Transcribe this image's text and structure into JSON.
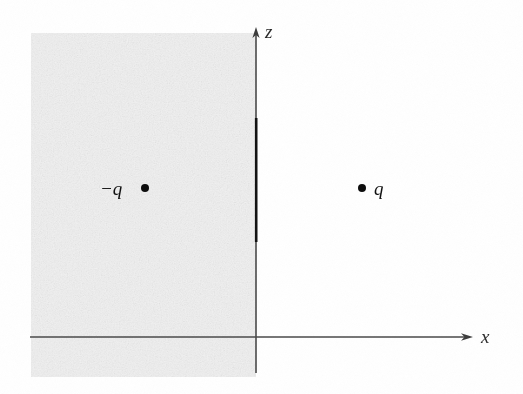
{
  "figure": {
    "background_color": "#ffffff",
    "width": 523,
    "height": 394
  },
  "conductor_region": {
    "name": "shaded-conductor-half-space",
    "fill_color": "#f1f1f1",
    "x": 31,
    "y": 33,
    "width": 225,
    "height": 344
  },
  "axes": {
    "stroke_color": "#4a4a4a",
    "x_axis": {
      "label": "x",
      "start_x": 30,
      "end_x": 472,
      "y": 337,
      "arrow": "right"
    },
    "z_axis": {
      "label": "z",
      "x": 256,
      "start_y": 373,
      "end_y": 28,
      "arrow": "up"
    }
  },
  "charges": [
    {
      "name": "image-charge",
      "label": "−q",
      "label_side": "left",
      "dot_color": "#0d0d0d",
      "x": 145,
      "y": 188,
      "sign": "negative"
    },
    {
      "name": "source-charge",
      "label": "q",
      "label_side": "right",
      "dot_color": "#0d0d0d",
      "x": 362,
      "y": 188,
      "sign": "positive"
    }
  ]
}
